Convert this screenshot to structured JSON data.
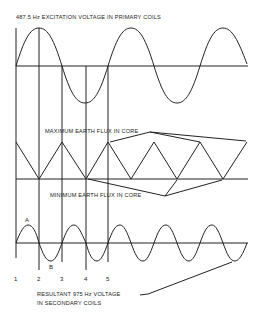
{
  "title": "487.5 Hz EXCITATION VOLTAGE IN PRIMARY COILS",
  "labels": {
    "max_flux": "MAXIMUM EARTH FLUX IN CORE",
    "min_flux": "MINIMUM EARTH FLUX IN CORE",
    "resultant_line1": "RESULTANT 975 Hz VOLTAGE",
    "resultant_line2": "IN SECONDARY COILS",
    "point_a": "A",
    "point_b": "B"
  },
  "markers": [
    "1",
    "2",
    "3",
    "4",
    "5"
  ],
  "waves": [
    {
      "name": "primary-excitation",
      "type": "sine",
      "cycles": 2.5
    },
    {
      "name": "earth-flux",
      "type": "triangle",
      "peaks": 5
    },
    {
      "name": "secondary-voltage",
      "type": "sine",
      "cycles": 5
    }
  ]
}
